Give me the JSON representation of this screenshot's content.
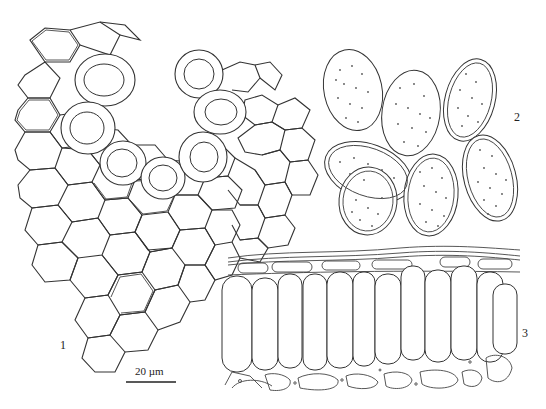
{
  "figure": {
    "panels": [
      {
        "id": "1",
        "label": "1",
        "description": "Polygonal cell network with thick-walled rounded cells"
      },
      {
        "id": "2",
        "label": "2",
        "description": "Ellipsoid spores with punctate ornamentation and spiny margins"
      },
      {
        "id": "3",
        "label": "3",
        "description": "Transverse section showing palisade layer of elongated cells"
      }
    ],
    "scale_bar": {
      "label": "20 µm"
    },
    "colors": {
      "line": "#333333",
      "background": "#ffffff"
    }
  }
}
